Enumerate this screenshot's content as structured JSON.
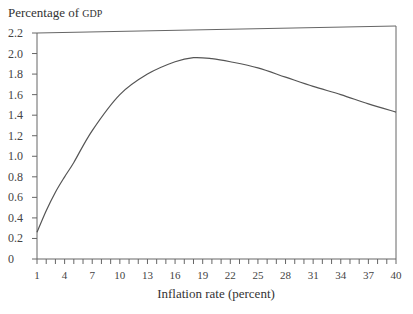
{
  "chart_data": {
    "type": "line",
    "title": "",
    "ylabel": "Percentage of GDP",
    "xlabel": "Inflation rate (percent)",
    "xlim": [
      1,
      40
    ],
    "ylim": [
      0,
      2.2
    ],
    "grid": false,
    "legend": null,
    "x_ticks": [
      1,
      4,
      7,
      10,
      13,
      16,
      19,
      22,
      25,
      28,
      31,
      34,
      37,
      40
    ],
    "x_minor_tick_step": 1,
    "y_ticks": [
      0,
      0.2,
      0.4,
      0.6,
      0.8,
      1.0,
      1.2,
      1.4,
      1.6,
      1.8,
      2.0,
      2.2
    ],
    "y_tick_labels": [
      "0",
      "0.2",
      "0.4",
      "0.6",
      "0.8",
      "1.0",
      "1.2",
      "1.4",
      "1.6",
      "1.8",
      "2.0",
      "2.2"
    ],
    "series": [
      {
        "name": "Percentage of GDP",
        "x": [
          1,
          2,
          3,
          4,
          5,
          7,
          10,
          13,
          16,
          18,
          20,
          22,
          25,
          28,
          31,
          34,
          37,
          40
        ],
        "values": [
          0.26,
          0.47,
          0.65,
          0.8,
          0.94,
          1.25,
          1.6,
          1.8,
          1.92,
          1.96,
          1.95,
          1.92,
          1.86,
          1.77,
          1.68,
          1.6,
          1.51,
          1.43
        ]
      }
    ]
  },
  "labels": {
    "y_title_main": "Percentage of ",
    "y_title_small": "GDP",
    "x_title": "Inflation rate (percent)"
  }
}
